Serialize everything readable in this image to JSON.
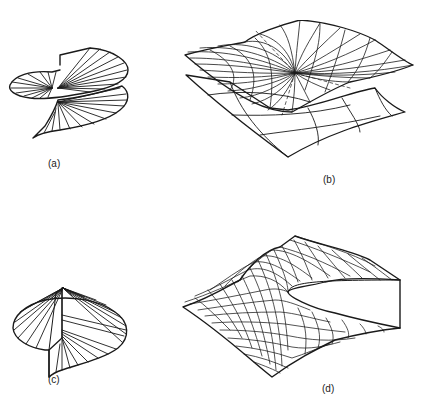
{
  "figure": {
    "panels": [
      {
        "id": "a",
        "label": "(a)",
        "description": "Spiral (helicoid) fan surface with radial rulings, two overlapping sheets"
      },
      {
        "id": "b",
        "label": "(b)",
        "description": "Two stacked wireframe sheets; upper sheet with dense mesh converging to a singular point"
      },
      {
        "id": "c",
        "label": "(c)",
        "description": "Cut disc fan surface with radial rulings and a vertical slit"
      },
      {
        "id": "d",
        "label": "(d)",
        "description": "Wireframe surface mesh with an open slit / wedge cut on the right side"
      }
    ]
  },
  "colors": {
    "ink": "#1a1a1a",
    "background": "#ffffff"
  }
}
